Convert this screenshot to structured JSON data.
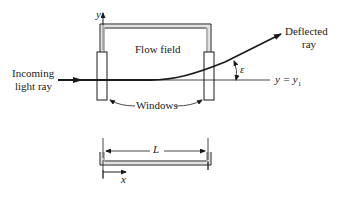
{
  "diagram": {
    "labels": {
      "y_axis": "y",
      "x_axis": "x",
      "flow_field": "Flow field",
      "incoming_line1": "Incoming",
      "incoming_line2": "light ray",
      "deflected_line1": "Deflected",
      "deflected_line2": "ray",
      "windows": "Windows",
      "length": "L",
      "epsilon": "ε",
      "reference_line": "y = y",
      "reference_sub": "1"
    },
    "colors": {
      "stroke": "#1a1a1a",
      "wall_fill": "#bdbdbd",
      "background": "#ffffff"
    }
  }
}
